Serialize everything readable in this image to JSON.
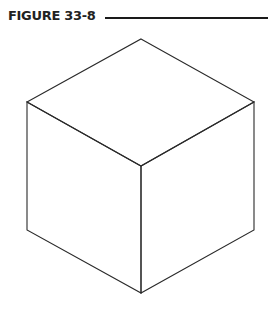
{
  "figure": {
    "label": "FIGURE 33-8",
    "rule_color": "#1a1a1a"
  },
  "diagram": {
    "stroke_color": "#2a2a2a",
    "vertices": {
      "top": [
        141,
        39
      ],
      "upper_left": [
        27,
        102
      ],
      "upper_right": [
        254,
        102
      ],
      "front_top": [
        141,
        166
      ],
      "lower_left": [
        27,
        230
      ],
      "lower_right": [
        254,
        230
      ],
      "front_bottom": [
        141,
        293
      ]
    }
  }
}
